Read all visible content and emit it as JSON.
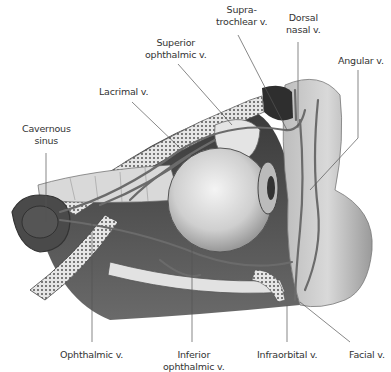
{
  "figure": {
    "labels": {
      "supratrochlear": [
        "Supra-",
        "trochlear v."
      ],
      "dorsal_nasal": [
        "Dorsal",
        "nasal v."
      ],
      "superior_ophthalmic": [
        "Superior",
        "ophthalmic v."
      ],
      "angular": [
        "Angular v."
      ],
      "lacrimal": [
        "Lacrimal v."
      ],
      "cavernous_sinus": [
        "Cavernous",
        "sinus"
      ],
      "ophthalmic": [
        "Ophthalmic v."
      ],
      "inferior_ophthalmic": [
        "Inferior",
        "ophthalmic v."
      ],
      "infraorbital": [
        "Infraorbital v."
      ],
      "facial": [
        "Facial v."
      ]
    }
  }
}
